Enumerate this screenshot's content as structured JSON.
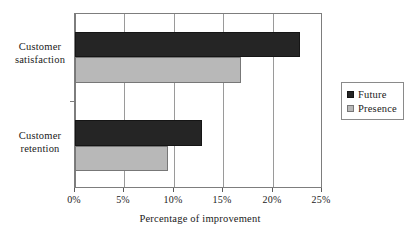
{
  "chart_data": {
    "type": "bar",
    "orientation": "horizontal",
    "title": "",
    "xlabel": "Percentage of improvement",
    "ylabel": "",
    "xlim": [
      0,
      25
    ],
    "xunit": "%",
    "grid": true,
    "legend_position": "right",
    "categories": [
      "Customer satisfaction",
      "Customer retention"
    ],
    "category_lines": [
      [
        "Customer",
        "satisfaction"
      ],
      [
        "Customer",
        "retention"
      ]
    ],
    "xticks": [
      0,
      5,
      10,
      15,
      20,
      25
    ],
    "xticklabels": [
      "0%",
      "5%",
      "10%",
      "15%",
      "20%",
      "25%"
    ],
    "series": [
      {
        "name": "Future",
        "color": "#252525",
        "values": [
          22.9,
          12.9
        ]
      },
      {
        "name": "Presence",
        "color": "#b8b8b8",
        "values": [
          16.9,
          9.5
        ]
      }
    ]
  },
  "legend": {
    "items": [
      {
        "label": "Future",
        "color": "#252525"
      },
      {
        "label": "Presence",
        "color": "#b8b8b8"
      }
    ]
  },
  "axis": {
    "x_title": "Percentage of improvement",
    "tick_labels": [
      "0%",
      "5%",
      "10%",
      "15%",
      "20%",
      "25%"
    ]
  },
  "categories": {
    "satisfaction": {
      "line1": "Customer",
      "line2": "satisfaction"
    },
    "retention": {
      "line1": "Customer",
      "line2": "retention"
    }
  },
  "colors": {
    "future": "#252525",
    "presence": "#b8b8b8",
    "axis": "#7d7d7d",
    "grid": "#9a9a9a",
    "background": "#ffffff"
  }
}
